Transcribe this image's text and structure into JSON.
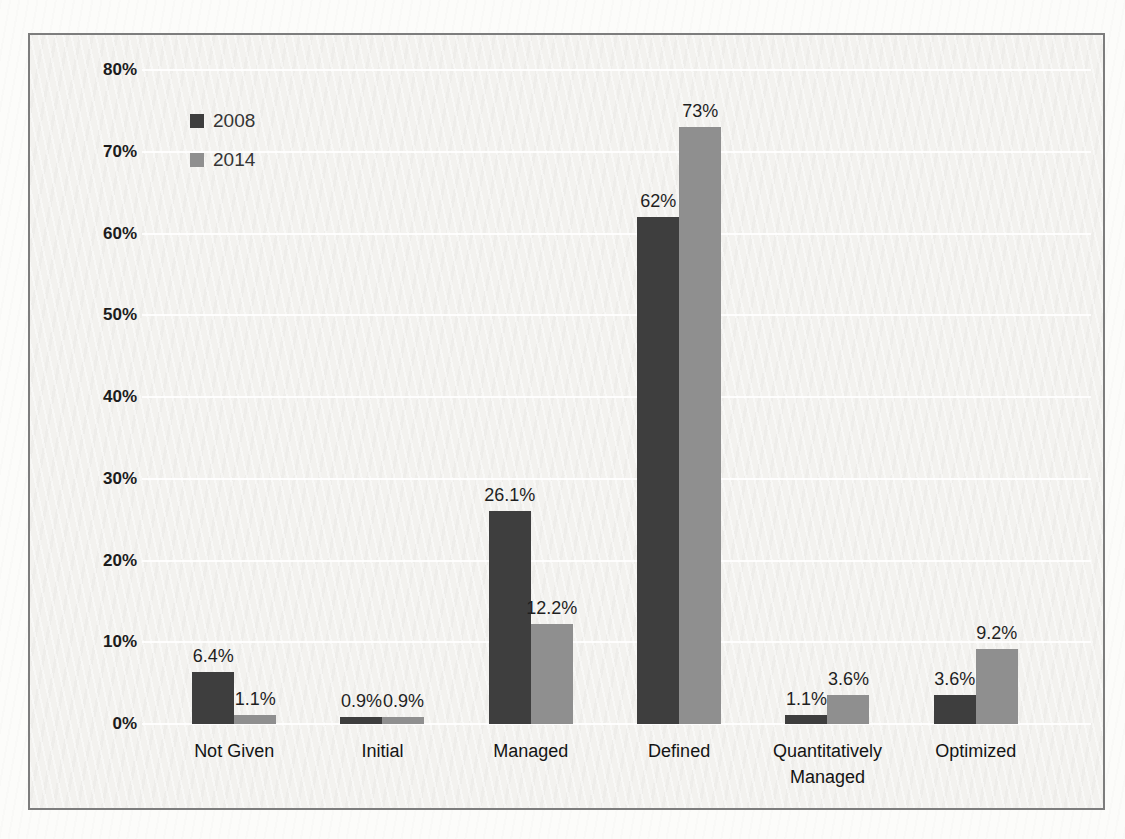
{
  "chart_data": {
    "type": "bar",
    "title": "",
    "categories": [
      "Not Given",
      "Initial",
      "Managed",
      "Defined",
      "Quantitatively Managed",
      "Optimized"
    ],
    "series": [
      {
        "name": "2008",
        "color": "#3e3e3e",
        "values": [
          6.4,
          0.9,
          26.1,
          62,
          1.1,
          3.6
        ],
        "data_labels": [
          "6.4%",
          "0.9%",
          "26.1%",
          "62%",
          "1.1%",
          "3.6%"
        ]
      },
      {
        "name": "2014",
        "color": "#8f8f8f",
        "values": [
          1.1,
          0.9,
          12.2,
          73,
          3.6,
          9.2
        ],
        "data_labels": [
          "1.1%",
          "0.9%",
          "12.2%",
          "73%",
          "3.6%",
          "9.2%"
        ]
      }
    ],
    "y_axis": {
      "min": 0,
      "max": 80,
      "step": 10,
      "tick_labels": [
        "0%",
        "10%",
        "20%",
        "30%",
        "40%",
        "50%",
        "60%",
        "70%",
        "80%"
      ]
    },
    "xlabel": "",
    "ylabel": "",
    "ylim": [
      0,
      80
    ],
    "grid": true,
    "legend": {
      "position": "top-left",
      "entries": [
        {
          "label": "2008",
          "color": "#3e3e3e"
        },
        {
          "label": "2014",
          "color": "#8f8f8f"
        }
      ]
    }
  }
}
